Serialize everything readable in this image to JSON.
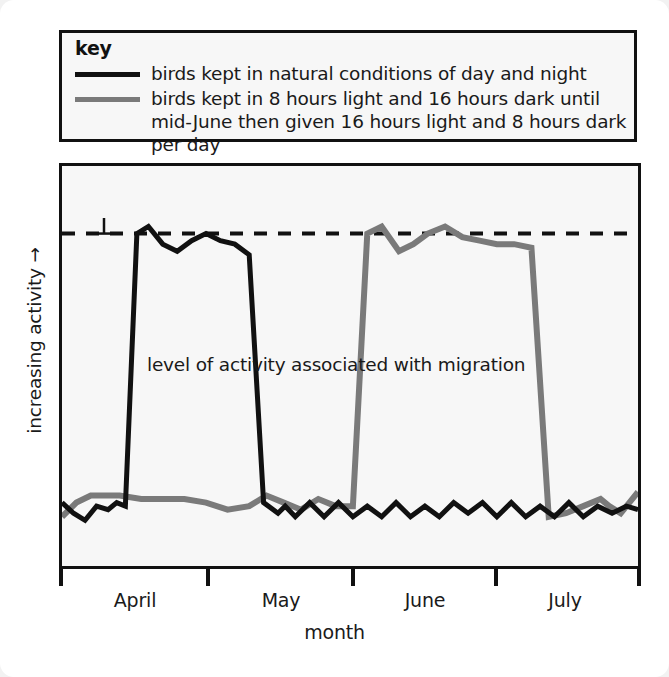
{
  "key": {
    "title": "key",
    "entries": [
      {
        "color": "#111111",
        "label": "birds kept in natural conditions of day and night"
      },
      {
        "color": "#7a7a7a",
        "label": "birds kept in 8 hours light and 16 hours dark until mid-June then given 16 hours light and 8 hours dark per day"
      }
    ]
  },
  "chart_data": {
    "type": "line",
    "title": "",
    "xlabel": "month",
    "ylabel": "increasing activity →",
    "annotation": "level of activity associated with migration",
    "grid": false,
    "legend_position": "top",
    "x_tick_labels": [
      "April",
      "May",
      "June",
      "July"
    ],
    "x_tick_positions": [
      0,
      1,
      2,
      3,
      4
    ],
    "ylim": [
      0,
      1
    ],
    "threshold_line": {
      "label": "level of activity associated with migration",
      "value": 0.86,
      "style": "dashed",
      "color": "#111111"
    },
    "series": [
      {
        "name": "birds kept in natural conditions of day and night",
        "color": "#111111",
        "x": [
          0.0,
          0.08,
          0.16,
          0.24,
          0.32,
          0.38,
          0.44,
          0.52,
          0.6,
          0.7,
          0.8,
          0.9,
          1.0,
          1.1,
          1.2,
          1.3,
          1.4,
          1.5,
          1.55,
          1.62,
          1.72,
          1.82,
          1.92,
          2.02,
          2.12,
          2.22,
          2.32,
          2.42,
          2.52,
          2.62,
          2.72,
          2.82,
          2.92,
          3.02,
          3.12,
          3.22,
          3.32,
          3.42,
          3.52,
          3.62,
          3.72,
          3.82,
          3.92,
          4.0
        ],
        "y": [
          0.1,
          0.07,
          0.05,
          0.09,
          0.08,
          0.1,
          0.09,
          0.86,
          0.88,
          0.83,
          0.81,
          0.84,
          0.86,
          0.84,
          0.83,
          0.8,
          0.1,
          0.07,
          0.09,
          0.06,
          0.1,
          0.06,
          0.1,
          0.06,
          0.09,
          0.06,
          0.1,
          0.06,
          0.09,
          0.06,
          0.1,
          0.07,
          0.1,
          0.06,
          0.1,
          0.06,
          0.09,
          0.06,
          0.1,
          0.06,
          0.09,
          0.07,
          0.09,
          0.08
        ]
      },
      {
        "name": "birds kept in 8 hours light and 16 hours dark until mid-June then given 16 hours light and 8 hours dark per day",
        "color": "#7a7a7a",
        "x": [
          0.0,
          0.1,
          0.2,
          0.3,
          0.4,
          0.55,
          0.7,
          0.85,
          1.0,
          1.15,
          1.3,
          1.42,
          1.54,
          1.66,
          1.78,
          1.9,
          2.02,
          2.12,
          2.22,
          2.34,
          2.44,
          2.54,
          2.66,
          2.78,
          2.9,
          3.02,
          3.14,
          3.26,
          3.38,
          3.5,
          3.62,
          3.74,
          3.8,
          3.88,
          3.94,
          4.0
        ],
        "y": [
          0.06,
          0.1,
          0.12,
          0.12,
          0.12,
          0.11,
          0.11,
          0.11,
          0.1,
          0.08,
          0.09,
          0.12,
          0.1,
          0.08,
          0.11,
          0.09,
          0.09,
          0.86,
          0.88,
          0.81,
          0.83,
          0.86,
          0.88,
          0.85,
          0.84,
          0.83,
          0.83,
          0.82,
          0.06,
          0.07,
          0.09,
          0.11,
          0.09,
          0.07,
          0.1,
          0.13
        ]
      }
    ]
  }
}
